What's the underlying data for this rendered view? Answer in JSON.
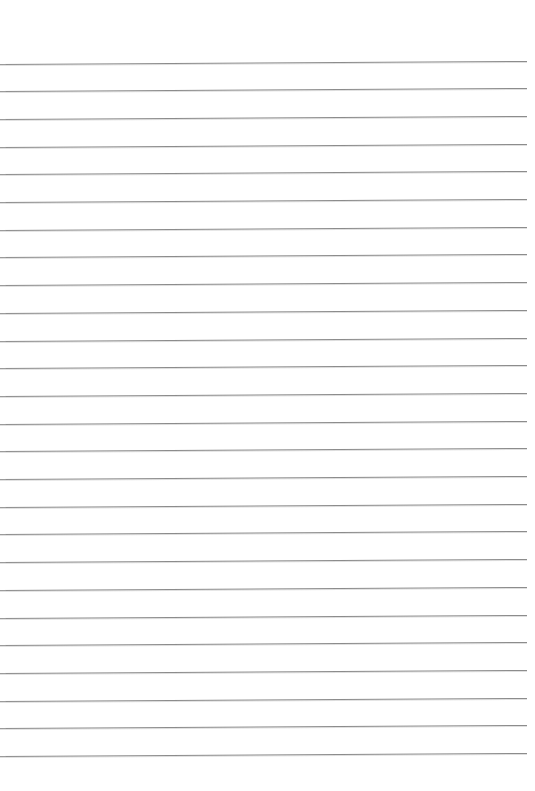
{
  "document": {
    "kind": "ruled-paper-scan",
    "type": "blank lined notebook page",
    "page_width": 535,
    "page_height": 791,
    "background_color": "#ffffff",
    "text_content": "",
    "has_text": false,
    "has_handwriting": false,
    "has_header": false,
    "has_page_number": false
  },
  "ruling": {
    "line_color": "#8c8c8c",
    "line_thickness_px": 1,
    "line_count": 26,
    "line_spacing_px": 27.7,
    "first_line_y": 63,
    "last_line_y": 756,
    "line_start_x": 0,
    "line_end_x": 527,
    "skew_degrees": -0.33,
    "top_margin_px": 63,
    "bottom_margin_px": 35,
    "left_margin_px": 0,
    "right_margin_px": 8,
    "has_vertical_margin_rule": false,
    "line_y_positions": [
      63.5,
      91.2,
      118.9,
      146.6,
      174.3,
      202.0,
      229.7,
      257.4,
      285.1,
      312.8,
      340.5,
      368.2,
      395.9,
      423.6,
      451.3,
      479.0,
      506.7,
      534.4,
      562.1,
      589.8,
      617.5,
      645.2,
      672.9,
      700.6,
      728.3,
      756.0
    ],
    "line_lengths_px": [
      527,
      527,
      527,
      527,
      527,
      527,
      527,
      527,
      527,
      527,
      527,
      527,
      527,
      527,
      527,
      527,
      527,
      527,
      527,
      527,
      527,
      527,
      527,
      527,
      527,
      527
    ],
    "row_labels": [
      "line-1",
      "line-2",
      "line-3",
      "line-4",
      "line-5",
      "line-6",
      "line-7",
      "line-8",
      "line-9",
      "line-10",
      "line-11",
      "line-12",
      "line-13",
      "line-14",
      "line-15",
      "line-16",
      "line-17",
      "line-18",
      "line-19",
      "line-20",
      "line-21",
      "line-22",
      "line-23",
      "line-24",
      "line-25",
      "line-26"
    ]
  }
}
